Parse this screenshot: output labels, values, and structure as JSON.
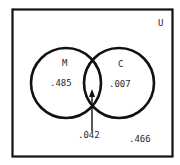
{
  "diagram": {
    "type": "venn",
    "universe": {
      "label": "U",
      "outside_value": ".466"
    },
    "sets": [
      {
        "label": "M",
        "only_value": ".485"
      },
      {
        "label": "C",
        "only_value": ".007"
      }
    ],
    "intersection": {
      "value": ".042",
      "pointer": "arrow"
    },
    "colors": {
      "stroke": "#111111",
      "text": "#2a2a2a",
      "background": "#ffffff"
    }
  }
}
